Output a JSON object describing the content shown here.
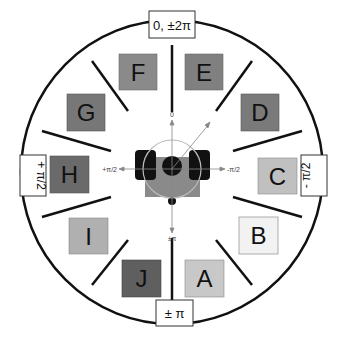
{
  "angle_labels": {
    "top": "0, ±2π",
    "left": "+ π/2",
    "right": "- π/2",
    "bottom": "± π"
  },
  "axis_labels": {
    "up": "0",
    "left": "+π/2",
    "right": "-π/2",
    "down": "±π"
  },
  "targets": [
    {
      "id": "A",
      "label": "A",
      "color": "#c8c8c8"
    },
    {
      "id": "B",
      "label": "B",
      "color": "#f2f2f2"
    },
    {
      "id": "C",
      "label": "C",
      "color": "#c0c0c0"
    },
    {
      "id": "D",
      "label": "D",
      "color": "#7a7a7a"
    },
    {
      "id": "E",
      "label": "E",
      "color": "#808080"
    },
    {
      "id": "F",
      "label": "F",
      "color": "#8a8a8a"
    },
    {
      "id": "G",
      "label": "G",
      "color": "#777777"
    },
    {
      "id": "H",
      "label": "H",
      "color": "#6a6a6a"
    },
    {
      "id": "I",
      "label": "I",
      "color": "#b0b0b0"
    },
    {
      "id": "J",
      "label": "J",
      "color": "#5f5f5f"
    }
  ]
}
